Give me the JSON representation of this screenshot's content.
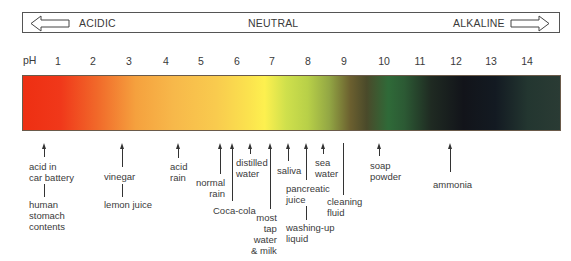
{
  "scale": {
    "acidic_label": "ACIDIC",
    "neutral_label": "NEUTRAL",
    "alkaline_label": "ALKALINE",
    "left_arrow_icon": "arrow-left-outline-icon",
    "right_arrow_icon": "arrow-right-outline-icon"
  },
  "axis": {
    "label": "pH",
    "ticks": [
      "1",
      "2",
      "3",
      "4",
      "5",
      "6",
      "7",
      "8",
      "9",
      "10",
      "11",
      "12",
      "13",
      "14"
    ]
  },
  "bar": {
    "colors": [
      "#ee2f12",
      "#f16a2a",
      "#f7b84a",
      "#fdf04f",
      "#b8d048",
      "#6b5f2f",
      "#2f6a38",
      "#12141a",
      "#2a3b34"
    ]
  },
  "substances": {
    "acid_battery": "acid in\ncar battery",
    "stomach": "human\nstomach\ncontents",
    "vinegar": "vinegar",
    "lemon": "lemon juice",
    "acid_rain": "acid\nrain",
    "normal_rain": "normal\nrain",
    "coca_cola": "Coca-cola",
    "distilled": "distilled\nwater",
    "tap_water": "most\ntap\nwater\n& milk",
    "saliva": "saliva",
    "pancreatic": "pancreatic\njuice",
    "washing_up": "washing-up\nliquid",
    "sea_water": "sea\nwater",
    "cleaning": "cleaning\nfluid",
    "soap": "soap\npowder",
    "ammonia": "ammonia"
  }
}
